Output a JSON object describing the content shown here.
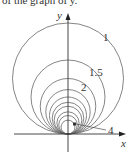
{
  "caption": "of the graph of y.",
  "diagram": {
    "type": "family-of-circles",
    "axes": {
      "x_label": "x",
      "y_label": "y"
    },
    "origin_px": [
      68,
      134
    ],
    "base_diameter_px": 111,
    "curves": [
      {
        "param": 1,
        "label": "1",
        "labeled": true
      },
      {
        "param": 1.5,
        "label": "1.5",
        "labeled": true
      },
      {
        "param": 2,
        "label": "2",
        "labeled": true
      },
      {
        "param": 2.5,
        "label": "",
        "labeled": false
      },
      {
        "param": 3,
        "label": "",
        "labeled": false
      },
      {
        "param": 3.5,
        "label": "",
        "labeled": false
      },
      {
        "param": 4,
        "label": "4",
        "labeled": true
      },
      {
        "param": 5,
        "label": "",
        "labeled": false
      },
      {
        "param": 6,
        "label": "",
        "labeled": false
      },
      {
        "param": 8,
        "label": "",
        "labeled": false
      }
    ],
    "labels": {
      "one": "1",
      "one_five": "1.5",
      "two": "2",
      "four": "4"
    },
    "colors": {
      "stroke": "#555555",
      "axis": "#333333"
    }
  }
}
